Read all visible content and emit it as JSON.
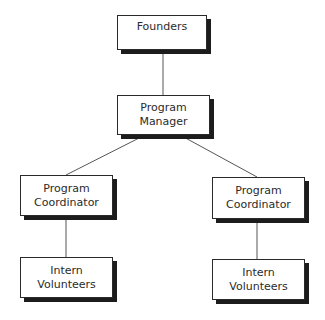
{
  "chart": {
    "nodes": [
      {
        "id": "founders",
        "lines": [
          "Founders"
        ]
      },
      {
        "id": "program-manager",
        "lines": [
          "Program",
          "Manager"
        ]
      },
      {
        "id": "coordinator-left",
        "lines": [
          "Program",
          "Coordinator"
        ]
      },
      {
        "id": "coordinator-right",
        "lines": [
          "Program",
          "Coordinator"
        ]
      },
      {
        "id": "interns-left",
        "lines": [
          "Intern",
          "Volunteers"
        ]
      },
      {
        "id": "interns-right",
        "lines": [
          "Intern",
          "Volunteers"
        ]
      }
    ],
    "edges": [
      [
        "founders",
        "program-manager"
      ],
      [
        "program-manager",
        "coordinator-left"
      ],
      [
        "program-manager",
        "coordinator-right"
      ],
      [
        "coordinator-left",
        "interns-left"
      ],
      [
        "coordinator-right",
        "interns-right"
      ]
    ]
  }
}
